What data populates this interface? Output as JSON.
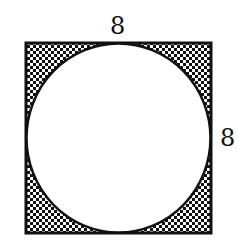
{
  "figure": {
    "shape_outer": "square",
    "shape_inner": "inscribed-circle",
    "shaded_region": "square-minus-circle",
    "shading_pattern": "checkerboard",
    "colors": {
      "stroke": "#111111",
      "fill_light": "#ffffff",
      "fill_dark": "#111111",
      "background": "#ffffff"
    }
  },
  "labels": {
    "top_side": "8",
    "right_side": "8"
  }
}
